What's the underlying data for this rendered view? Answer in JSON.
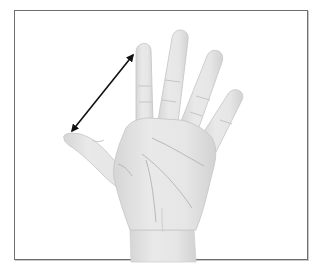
{
  "figure": {
    "annotation": {
      "type": "double-headed-arrow",
      "description": "span measured from thumb tip to index finger tip",
      "from": [
        72,
        131
      ],
      "to": [
        133,
        55
      ],
      "color": "#111111"
    },
    "colors": {
      "frame_border": "#6e6e6e",
      "background": "#ffffff",
      "skin_fill": "#e6e6e6",
      "skin_shade": "#cfcfcf",
      "skin_line": "#b8b8b8"
    },
    "caption": ""
  }
}
